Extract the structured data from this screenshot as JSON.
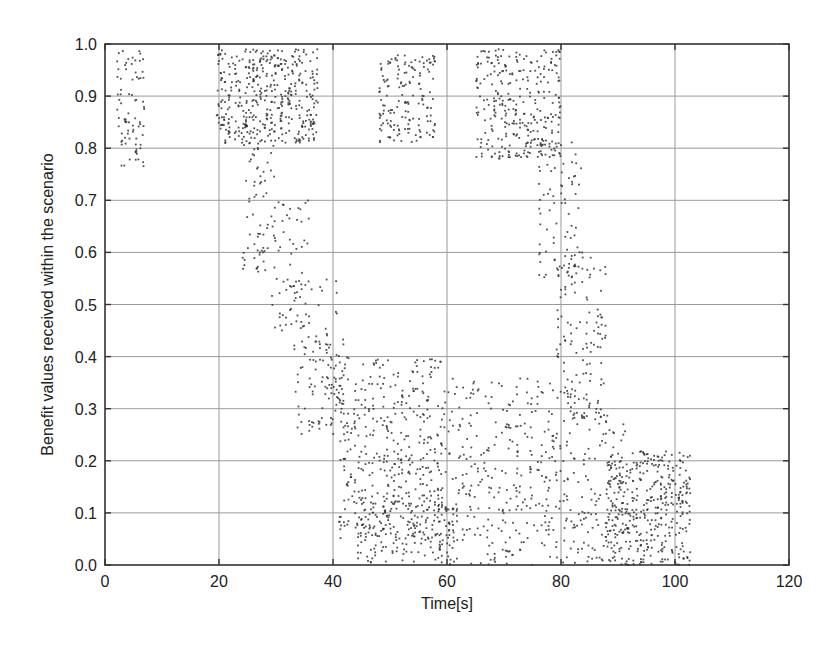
{
  "chart_data": {
    "type": "scatter",
    "title": "",
    "xlabel": "Time[s]",
    "ylabel": "Benefit values received within the scenario",
    "xlim": [
      0,
      120
    ],
    "ylim": [
      0.0,
      1.0
    ],
    "xticks": [
      0,
      20,
      40,
      60,
      80,
      100,
      120
    ],
    "xtick_labels": [
      "0",
      "20",
      "40",
      "60",
      "80",
      "100",
      "120"
    ],
    "yticks": [
      0.0,
      0.1,
      0.2,
      0.3,
      0.4,
      0.5,
      0.6,
      0.7,
      0.8,
      0.9,
      1.0
    ],
    "ytick_labels": [
      "0.0",
      "0.1",
      "0.2",
      "0.3",
      "0.4",
      "0.5",
      "0.6",
      "0.7",
      "0.8",
      "0.9",
      "1.0"
    ],
    "grid": true,
    "legend": null,
    "marker": "small dots",
    "marker_color": "#333333",
    "series": [
      {
        "name": "benefit samples",
        "description": "Dense scatter of benefit values over time; high benefit (0.8–1.0) in early bursts, dropping to 0.0–0.4 between ~40–100 s",
        "clusters": [
          {
            "x": [
              2,
              7
            ],
            "y": [
              0.76,
              0.99
            ],
            "n": 80,
            "note": "initial burst, centered ~0.88"
          },
          {
            "x": [
              19.5,
              37.5
            ],
            "y": [
              0.81,
              0.99
            ],
            "n": 420,
            "note": "high plateau, densest ~0.85–0.92"
          },
          {
            "x": [
              24,
              30
            ],
            "y": [
              0.56,
              0.85
            ],
            "n": 80,
            "note": "decline start"
          },
          {
            "x": [
              29,
              36
            ],
            "y": [
              0.45,
              0.7
            ],
            "n": 60,
            "note": "decline"
          },
          {
            "x": [
              33,
              41
            ],
            "y": [
              0.25,
              0.55
            ],
            "n": 90,
            "note": "decline toward 0.3"
          },
          {
            "x": [
              38,
              42
            ],
            "y": [
              0.25,
              0.45
            ],
            "n": 40,
            "note": "decline end"
          },
          {
            "x": [
              48,
              58
            ],
            "y": [
              0.81,
              0.98
            ],
            "n": 160,
            "note": "second high burst"
          },
          {
            "x": [
              41,
              60
            ],
            "y": [
              0.05,
              0.4
            ],
            "n": 420,
            "note": "low band, dense ~0.15–0.30"
          },
          {
            "x": [
              44,
              62
            ],
            "y": [
              0.0,
              0.12
            ],
            "n": 160,
            "note": "floor band"
          },
          {
            "x": [
              65,
              80
            ],
            "y": [
              0.78,
              0.99
            ],
            "n": 300,
            "note": "third high burst, decreasing slope"
          },
          {
            "x": [
              76,
              84
            ],
            "y": [
              0.55,
              0.82
            ],
            "n": 80,
            "note": "decline"
          },
          {
            "x": [
              79,
              88
            ],
            "y": [
              0.28,
              0.6
            ],
            "n": 130,
            "note": "decline"
          },
          {
            "x": [
              60,
              82
            ],
            "y": [
              0.0,
              0.36
            ],
            "n": 330,
            "note": "low band"
          },
          {
            "x": [
              82,
              92
            ],
            "y": [
              0.0,
              0.3
            ],
            "n": 140,
            "note": "low band"
          },
          {
            "x": [
              88,
              103
            ],
            "y": [
              0.0,
              0.22
            ],
            "n": 380,
            "note": "final band, dense ~0.08"
          }
        ]
      }
    ]
  },
  "plot_area": {
    "left_px": 105,
    "right_px": 789,
    "top_px": 44,
    "bottom_px": 565
  }
}
